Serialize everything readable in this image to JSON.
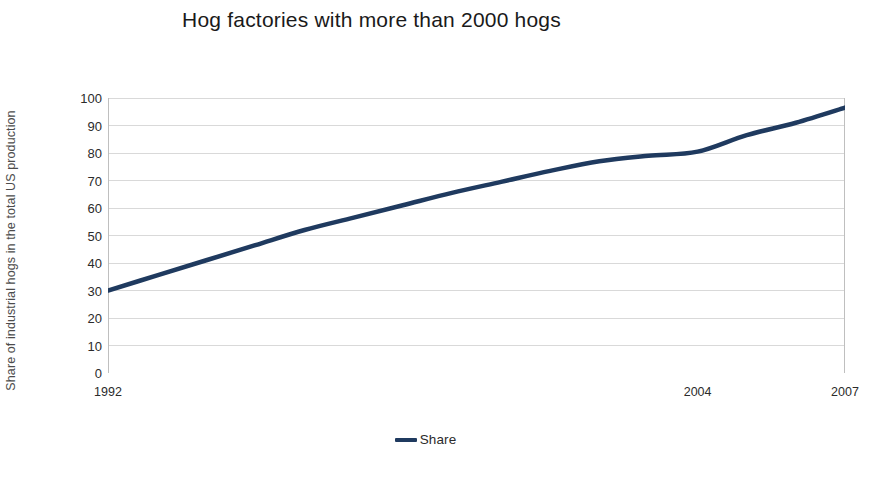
{
  "chart_data": {
    "type": "line",
    "title": "Hog factories with more than 2000 hogs",
    "xlabel": "",
    "ylabel": "Share of industrial hogs in the total US production",
    "xlim": [
      1992,
      2007
    ],
    "ylim": [
      0,
      100
    ],
    "grid": true,
    "legend_position": "bottom-center",
    "y_ticks": [
      100,
      90,
      80,
      70,
      60,
      50,
      40,
      30,
      20,
      10,
      0
    ],
    "x_ticks": [
      1992,
      2004,
      2007
    ],
    "x_tick_labels": [
      "1992",
      "2004",
      "2007"
    ],
    "series": [
      {
        "name": "Share",
        "color": "#1f3a5f",
        "x": [
          1992,
          1993,
          1994,
          1995,
          1996,
          1997,
          1998,
          1999,
          2000,
          2001,
          2002,
          2003,
          2004,
          2005,
          2006,
          2007
        ],
        "values": [
          30.0,
          35.5,
          41.0,
          46.5,
          52.0,
          56.5,
          61.0,
          65.5,
          69.5,
          73.5,
          77.0,
          79.0,
          80.5,
          86.5,
          91.0,
          96.5
        ]
      }
    ],
    "colors": {
      "line": "#1f3a5f",
      "grid": "#d9d9d9",
      "axis": "#bfbfbf",
      "text": "#2b2b2b",
      "title": "#1a1a1a",
      "background": "#ffffff"
    }
  },
  "legend": {
    "items": [
      {
        "label": "Share",
        "color": "#1f3a5f",
        "marker": "line-marker"
      }
    ]
  }
}
